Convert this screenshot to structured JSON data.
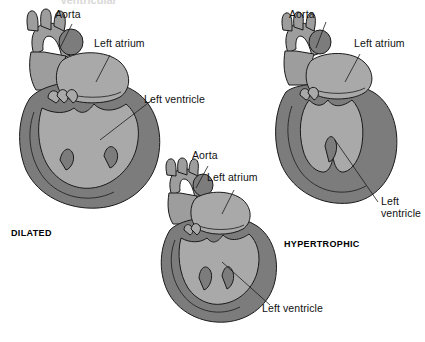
{
  "figure": {
    "title_cut": "Ventricular",
    "background": "#ffffff",
    "colors": {
      "myocardium_dark": "#7c7c7c",
      "chamber_light": "#a9a9a9",
      "vessel_light": "#9d9d9d",
      "outline": "#1a1a1a",
      "label_text": "#101010"
    }
  },
  "hearts": [
    {
      "id": "dilated",
      "caption": "DILATED",
      "labels": {
        "aorta": "Aorta",
        "left_atrium": "Left atrium",
        "left_ventricle": "Left ventricle"
      }
    },
    {
      "id": "middle",
      "caption": "",
      "labels": {
        "aorta": "Aorta",
        "left_atrium": "Left atrium",
        "left_ventricle": "Left ventricle"
      }
    },
    {
      "id": "hypertrophic",
      "caption": "HYPERTROPHIC",
      "labels": {
        "aorta": "Aorta",
        "left_atrium": "Left atrium",
        "left_ventricle": "Left ventricle"
      }
    }
  ]
}
